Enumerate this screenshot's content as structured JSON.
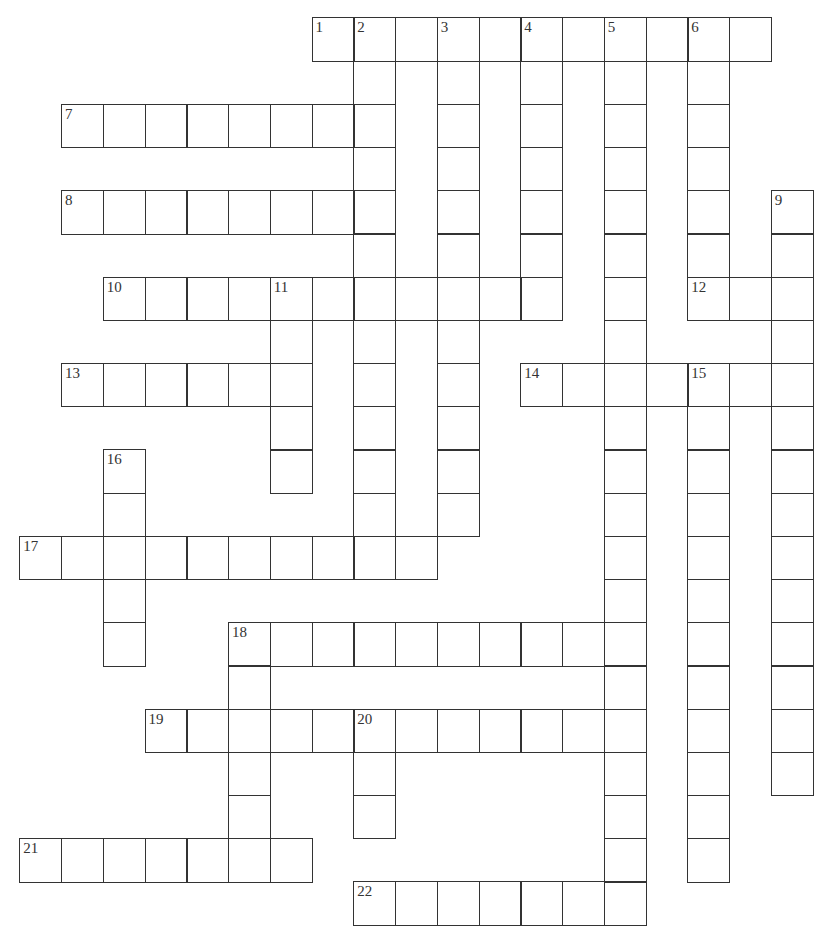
{
  "puzzle": {
    "grid": {
      "origin_x": 20,
      "origin_y": 18,
      "cell_width": 41.75,
      "cell_height": 43.2,
      "line_color": "#333333",
      "background": "#ffffff"
    },
    "words": [
      {
        "number": "1",
        "direction": "across",
        "row": 0,
        "col": 7,
        "length": 11
      },
      {
        "number": "2",
        "direction": "down",
        "row": 0,
        "col": 8,
        "length": 13
      },
      {
        "number": "3",
        "direction": "down",
        "row": 0,
        "col": 10,
        "length": 12
      },
      {
        "number": "4",
        "direction": "down",
        "row": 0,
        "col": 12,
        "length": 7
      },
      {
        "number": "5",
        "direction": "down",
        "row": 0,
        "col": 14,
        "length": 21
      },
      {
        "number": "6",
        "direction": "down",
        "row": 0,
        "col": 16,
        "length": 7
      },
      {
        "number": "7",
        "direction": "across",
        "row": 2,
        "col": 1,
        "length": 8
      },
      {
        "number": "8",
        "direction": "across",
        "row": 4,
        "col": 1,
        "length": 8
      },
      {
        "number": "9",
        "direction": "down",
        "row": 4,
        "col": 18,
        "length": 14
      },
      {
        "number": "10",
        "direction": "across",
        "row": 6,
        "col": 2,
        "length": 11
      },
      {
        "number": "11",
        "direction": "down",
        "row": 6,
        "col": 6,
        "length": 5
      },
      {
        "number": "12",
        "direction": "across",
        "row": 6,
        "col": 16,
        "length": 3
      },
      {
        "number": "13",
        "direction": "across",
        "row": 8,
        "col": 1,
        "length": 6
      },
      {
        "number": "14",
        "direction": "across",
        "row": 8,
        "col": 12,
        "length": 7
      },
      {
        "number": "15",
        "direction": "down",
        "row": 8,
        "col": 16,
        "length": 12
      },
      {
        "number": "16",
        "direction": "down",
        "row": 10,
        "col": 2,
        "length": 5
      },
      {
        "number": "17",
        "direction": "across",
        "row": 12,
        "col": 0,
        "length": 10
      },
      {
        "number": "18",
        "direction": "across",
        "row": 14,
        "col": 5,
        "length": 10
      },
      {
        "number": "18",
        "direction": "down",
        "row": 14,
        "col": 5,
        "length": 6
      },
      {
        "number": "19",
        "direction": "across",
        "row": 16,
        "col": 3,
        "length": 12
      },
      {
        "number": "20",
        "direction": "down",
        "row": 16,
        "col": 8,
        "length": 3
      },
      {
        "number": "21",
        "direction": "across",
        "row": 19,
        "col": 0,
        "length": 7
      },
      {
        "number": "22",
        "direction": "across",
        "row": 20,
        "col": 8,
        "length": 7
      }
    ]
  }
}
